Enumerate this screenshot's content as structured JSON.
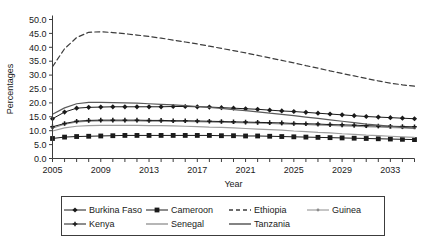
{
  "chart_data": {
    "type": "line",
    "title": "",
    "xlabel": "Year",
    "ylabel": "Percentages",
    "xlim": [
      2005,
      2035
    ],
    "ylim": [
      0.0,
      50.0
    ],
    "ytick_step": 5.0,
    "grid": false,
    "legend_position": "bottom",
    "x": [
      2005,
      2006,
      2007,
      2008,
      2009,
      2010,
      2011,
      2012,
      2013,
      2014,
      2015,
      2016,
      2017,
      2018,
      2019,
      2020,
      2021,
      2022,
      2023,
      2024,
      2025,
      2026,
      2027,
      2028,
      2029,
      2030,
      2031,
      2032,
      2033,
      2034,
      2035
    ],
    "xticks": [
      2005,
      2006,
      2007,
      2008,
      2009,
      2010,
      2011,
      2012,
      2013,
      2014,
      2015,
      2016,
      2017,
      2018,
      2019,
      2020,
      2021,
      2022,
      2023,
      2024,
      2025,
      2026,
      2027,
      2028,
      2029,
      2030,
      2031,
      2032,
      2033,
      2034,
      2035
    ],
    "xtick_labels": [
      "2005",
      "",
      "",
      "",
      "2009",
      "",
      "",
      "",
      "2013",
      "",
      "",
      "",
      "2017",
      "",
      "",
      "",
      "2021",
      "",
      "",
      "",
      "2025",
      "",
      "",
      "",
      "2029",
      "",
      "",
      "",
      "2033",
      "",
      ""
    ],
    "ytick_labels": [
      "0.0",
      "5.0",
      "10.0",
      "15.0",
      "20.0",
      "25.0",
      "30.0",
      "35.0",
      "40.0",
      "45.0",
      "50.0"
    ],
    "series": [
      {
        "name": "Burkina Faso",
        "marker": "diamond",
        "dash": "solid",
        "color": "#1a1a1a",
        "values": [
          14.3,
          16.7,
          18.1,
          18.4,
          18.5,
          18.6,
          18.6,
          18.6,
          18.6,
          18.6,
          18.7,
          18.7,
          18.6,
          18.5,
          18.3,
          18.1,
          17.9,
          17.7,
          17.4,
          17.1,
          16.9,
          16.6,
          16.3,
          16.0,
          15.7,
          15.4,
          15.1,
          14.9,
          14.7,
          14.5,
          14.3
        ]
      },
      {
        "name": "Cameroon",
        "marker": "square",
        "dash": "solid",
        "color": "#1a1a1a",
        "values": [
          7.2,
          7.7,
          7.9,
          8.0,
          8.1,
          8.2,
          8.3,
          8.3,
          8.3,
          8.3,
          8.3,
          8.3,
          8.3,
          8.3,
          8.2,
          8.2,
          8.1,
          8.1,
          8.0,
          7.9,
          7.8,
          7.7,
          7.6,
          7.5,
          7.4,
          7.3,
          7.2,
          7.1,
          7.0,
          6.9,
          6.8
        ]
      },
      {
        "name": "Ethiopia",
        "marker": "none",
        "dash": "dashed",
        "color": "#3c3c3c",
        "values": [
          33.0,
          39.5,
          43.5,
          45.4,
          45.6,
          45.3,
          44.9,
          44.4,
          43.9,
          43.3,
          42.6,
          41.9,
          41.2,
          40.4,
          39.6,
          38.8,
          38.0,
          37.1,
          36.2,
          35.3,
          34.4,
          33.4,
          32.5,
          31.5,
          30.6,
          29.7,
          28.8,
          27.9,
          27.1,
          26.5,
          26.0
        ]
      },
      {
        "name": "Guinea",
        "marker": "dot",
        "dash": "solid",
        "color": "#8c8c8c",
        "values": [
          10.9,
          12.3,
          13.1,
          13.4,
          13.5,
          13.5,
          13.5,
          13.5,
          13.4,
          13.4,
          13.3,
          13.3,
          13.2,
          13.1,
          13.0,
          12.9,
          12.8,
          12.7,
          12.6,
          12.4,
          12.3,
          12.2,
          12.0,
          11.9,
          11.7,
          11.6,
          11.4,
          11.3,
          11.1,
          11.0,
          10.9
        ]
      },
      {
        "name": "Kenya",
        "marker": "plus",
        "dash": "solid",
        "color": "#1a1a1a",
        "values": [
          11.4,
          12.6,
          13.4,
          13.7,
          13.8,
          13.8,
          13.8,
          13.8,
          13.7,
          13.7,
          13.6,
          13.6,
          13.5,
          13.4,
          13.3,
          13.2,
          13.1,
          13.0,
          12.9,
          12.8,
          12.6,
          12.5,
          12.4,
          12.2,
          12.1,
          12.0,
          11.8,
          11.7,
          11.6,
          11.5,
          11.4
        ]
      },
      {
        "name": "Senegal",
        "marker": "none",
        "dash": "solid",
        "color": "#9e9e9e",
        "values": [
          9.9,
          11.0,
          11.6,
          11.8,
          11.9,
          11.9,
          11.9,
          11.9,
          11.8,
          11.8,
          11.7,
          11.6,
          11.5,
          11.3,
          11.2,
          11.0,
          10.8,
          10.6,
          10.4,
          10.2,
          9.9,
          9.7,
          9.4,
          9.2,
          8.9,
          8.7,
          8.4,
          8.2,
          8.0,
          7.8,
          7.6
        ]
      },
      {
        "name": "Tanzania",
        "marker": "none",
        "dash": "solid",
        "color": "#5a5a5a",
        "values": [
          15.9,
          18.2,
          19.7,
          20.2,
          20.2,
          20.1,
          20.0,
          19.9,
          19.7,
          19.5,
          19.3,
          19.0,
          18.7,
          18.4,
          18.0,
          17.6,
          17.2,
          16.8,
          16.3,
          15.9,
          15.4,
          14.9,
          14.4,
          13.9,
          13.4,
          12.9,
          12.4,
          12.0,
          11.6,
          11.2,
          10.9
        ]
      }
    ]
  },
  "legend": {
    "rows": [
      [
        "Burkina Faso",
        "Cameroon",
        "Ethiopia",
        "Guinea"
      ],
      [
        "Kenya",
        "Senegal",
        "Tanzania"
      ]
    ]
  },
  "colors": {
    "axis": "#3c3c3c",
    "text": "#1a1a1a",
    "background": "#ffffff"
  }
}
